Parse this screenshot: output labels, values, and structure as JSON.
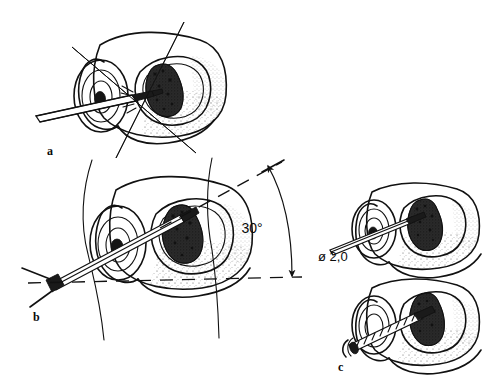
{
  "figure": {
    "background_color": "#ffffff",
    "ink_color": "#111111",
    "width": 504,
    "height": 388
  },
  "panels": [
    {
      "id": "a",
      "label": "a",
      "label_x": 47,
      "label_y": 155,
      "description": "Oblique view of vertebra with instrument entering pedicle, crossed alignment guide lines"
    },
    {
      "id": "b",
      "label": "b",
      "label_x": 33,
      "label_y": 321,
      "description": "Vertebra with drill handle at 30 degrees to horizontal, body contour lines"
    },
    {
      "id": "c",
      "label": "c",
      "label_x": 338,
      "label_y": 371,
      "description": "Two stacked vertebrae, upper with 2.0 mm drill, lower with threaded screw inserted"
    }
  ],
  "annotations": {
    "angle": {
      "value": "30",
      "unit": "°",
      "text": "30°",
      "x": 252,
      "y": 233
    },
    "diameter": {
      "symbol": "ø",
      "value": "2,0",
      "text": "ø 2,0",
      "x": 318,
      "y": 261
    }
  },
  "icons": {
    "angle_arrow": "double-headed-curved-arrow-icon",
    "drill_tool": "drill-instrument-icon",
    "screw_tool": "bone-screw-icon",
    "lesion": "tumor-lesion-icon"
  }
}
